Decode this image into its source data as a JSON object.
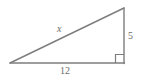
{
  "figure": {
    "type": "right-triangle-diagram",
    "stroke_color": "#7d7d7d",
    "label_color": "#6b6b6b",
    "background_color": "#ffffff",
    "vertices": {
      "left": [
        10,
        63
      ],
      "bottom_right": [
        124,
        63
      ],
      "top_right": [
        124,
        8
      ]
    },
    "right_angle_marker": {
      "name": "right-angle-square",
      "corner": "bottom-right",
      "size": 8
    },
    "labels": {
      "hypotenuse": "x",
      "vertical_leg": "5",
      "horizontal_leg": "12"
    }
  }
}
